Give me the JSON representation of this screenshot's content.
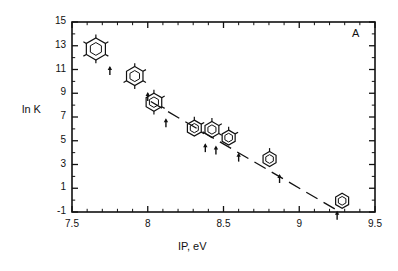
{
  "figure": {
    "panel_label": "A",
    "background": "#ffffff",
    "ink_color": "#111111"
  },
  "chart_data": {
    "type": "scatter",
    "title": "",
    "subtitle": "",
    "xlabel": "IP, eV",
    "ylabel": "ln K",
    "xlim": [
      7.5,
      9.5
    ],
    "ylim": [
      -1,
      15
    ],
    "grid": false,
    "legend": null,
    "xticks": [
      7.5,
      8,
      8.5,
      9,
      9.5
    ],
    "xticklabels": [
      "7.5",
      "8",
      "8.5",
      "9",
      "9.5"
    ],
    "xminor_step": 0.1,
    "yticks": [
      -1,
      1,
      3,
      5,
      7,
      9,
      11,
      13,
      15
    ],
    "yticklabels": [
      "-1",
      "1",
      "3",
      "5",
      "7",
      "9",
      "11",
      "13",
      "15"
    ],
    "yminor_step": 1,
    "tick_direction": "in",
    "frame": "box",
    "marker_style": "molecule-icon-with-arrow",
    "series": [
      {
        "name": "methylbenzenes",
        "x": [
          7.75,
          8.0,
          8.12,
          8.38,
          8.45,
          8.6,
          8.87,
          9.25
        ],
        "y": [
          11.3,
          9.1,
          6.9,
          4.8,
          4.6,
          4.0,
          2.2,
          -0.9
        ],
        "labels": [
          "hexamethylbenzene",
          "pentamethylbenzene",
          "tetramethylbenzene",
          "trimethylbenzene",
          "trimethylbenzene-isomer",
          "dimethylbenzene",
          "methylbenzene",
          "benzene"
        ],
        "methyl_counts": [
          6,
          5,
          4,
          3,
          3,
          2,
          1,
          0
        ]
      }
    ],
    "trendline": {
      "style": "dashed-segments",
      "x": [
        8.02,
        9.27
      ],
      "y": [
        8.3,
        -1.0
      ]
    }
  }
}
